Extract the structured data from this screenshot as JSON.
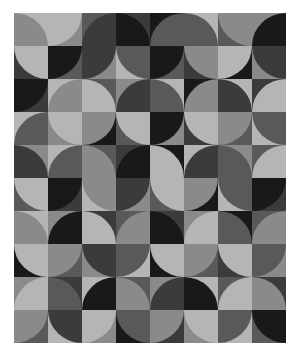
{
  "artwork": {
    "title": "Quarter-Circle Tile Pattern",
    "grid": {
      "columns": 8,
      "rows": 10,
      "tile_width": 34,
      "tile_height": 33
    },
    "canvas": {
      "x": 14,
      "y": 13,
      "width": 272,
      "height": 330,
      "background": "#ffffff"
    },
    "palette": {
      "p0": "#191919",
      "p1": "#3b3b3b",
      "p2": "#595959",
      "p3": "#8a8a8a",
      "p4": "#b5b5b5"
    },
    "corners": [
      "tl",
      "tr",
      "bl",
      "br"
    ],
    "tiles": [
      [
        {
          "bg": "p4",
          "arc": "p3",
          "corner": "bl"
        },
        {
          "bg": "p3",
          "arc": "p4",
          "corner": "tl"
        },
        {
          "bg": "p2",
          "arc": "p1",
          "corner": "br"
        },
        {
          "bg": "p1",
          "arc": "p0",
          "corner": "bl"
        },
        {
          "bg": "p0",
          "arc": "p2",
          "corner": "br"
        },
        {
          "bg": "p4",
          "arc": "p2",
          "corner": "bl"
        },
        {
          "bg": "p2",
          "arc": "p3",
          "corner": "tr"
        },
        {
          "bg": "p3",
          "arc": "p0",
          "corner": "br"
        }
      ],
      [
        {
          "bg": "p1",
          "arc": "p4",
          "corner": "tr"
        },
        {
          "bg": "p2",
          "arc": "p0",
          "corner": "tl"
        },
        {
          "bg": "p3",
          "arc": "p1",
          "corner": "tl"
        },
        {
          "bg": "p4",
          "arc": "p2",
          "corner": "tr"
        },
        {
          "bg": "p2",
          "arc": "p0",
          "corner": "tl"
        },
        {
          "bg": "p1",
          "arc": "p3",
          "corner": "tr"
        },
        {
          "bg": "p0",
          "arc": "p4",
          "corner": "tl"
        },
        {
          "bg": "p3",
          "arc": "p1",
          "corner": "tr"
        }
      ],
      [
        {
          "bg": "p1",
          "arc": "p0",
          "corner": "tl"
        },
        {
          "bg": "p4",
          "arc": "p3",
          "corner": "br"
        },
        {
          "bg": "p2",
          "arc": "p4",
          "corner": "bl"
        },
        {
          "bg": "p3",
          "arc": "p1",
          "corner": "br"
        },
        {
          "bg": "p4",
          "arc": "p2",
          "corner": "bl"
        },
        {
          "bg": "p0",
          "arc": "p3",
          "corner": "br"
        },
        {
          "bg": "p4",
          "arc": "p1",
          "corner": "bl"
        },
        {
          "bg": "p1",
          "arc": "p4",
          "corner": "br"
        }
      ],
      [
        {
          "bg": "p4",
          "arc": "p2",
          "corner": "br"
        },
        {
          "bg": "p3",
          "arc": "p4",
          "corner": "tr"
        },
        {
          "bg": "p0",
          "arc": "p3",
          "corner": "tl"
        },
        {
          "bg": "p2",
          "arc": "p4",
          "corner": "tr"
        },
        {
          "bg": "p3",
          "arc": "p0",
          "corner": "tl"
        },
        {
          "bg": "p1",
          "arc": "p4",
          "corner": "tr"
        },
        {
          "bg": "p2",
          "arc": "p3",
          "corner": "tl"
        },
        {
          "bg": "p4",
          "arc": "p2",
          "corner": "tr"
        }
      ],
      [
        {
          "bg": "p3",
          "arc": "p1",
          "corner": "bl"
        },
        {
          "bg": "p4",
          "arc": "p2",
          "corner": "br"
        },
        {
          "bg": "p2",
          "arc": "p3",
          "corner": "bl"
        },
        {
          "bg": "p1",
          "arc": "p0",
          "corner": "br"
        },
        {
          "bg": "p0",
          "arc": "p4",
          "corner": "bl"
        },
        {
          "bg": "p4",
          "arc": "p1",
          "corner": "br"
        },
        {
          "bg": "p3",
          "arc": "p2",
          "corner": "bl"
        },
        {
          "bg": "p2",
          "arc": "p4",
          "corner": "br"
        }
      ],
      [
        {
          "bg": "p2",
          "arc": "p4",
          "corner": "tr"
        },
        {
          "bg": "p1",
          "arc": "p0",
          "corner": "tl"
        },
        {
          "bg": "p4",
          "arc": "p3",
          "corner": "tr"
        },
        {
          "bg": "p3",
          "arc": "p1",
          "corner": "tl"
        },
        {
          "bg": "p2",
          "arc": "p4",
          "corner": "tr"
        },
        {
          "bg": "p0",
          "arc": "p3",
          "corner": "tl"
        },
        {
          "bg": "p4",
          "arc": "p2",
          "corner": "tr"
        },
        {
          "bg": "p1",
          "arc": "p0",
          "corner": "tl"
        }
      ],
      [
        {
          "bg": "p4",
          "arc": "p3",
          "corner": "bl"
        },
        {
          "bg": "p3",
          "arc": "p0",
          "corner": "br"
        },
        {
          "bg": "p1",
          "arc": "p4",
          "corner": "bl"
        },
        {
          "bg": "p2",
          "arc": "p3",
          "corner": "br"
        },
        {
          "bg": "p1",
          "arc": "p0",
          "corner": "bl"
        },
        {
          "bg": "p3",
          "arc": "p4",
          "corner": "br"
        },
        {
          "bg": "p0",
          "arc": "p2",
          "corner": "bl"
        },
        {
          "bg": "p2",
          "arc": "p3",
          "corner": "br"
        }
      ],
      [
        {
          "bg": "p0",
          "arc": "p4",
          "corner": "tr"
        },
        {
          "bg": "p2",
          "arc": "p3",
          "corner": "tl"
        },
        {
          "bg": "p3",
          "arc": "p1",
          "corner": "tr"
        },
        {
          "bg": "p4",
          "arc": "p2",
          "corner": "tl"
        },
        {
          "bg": "p0",
          "arc": "p4",
          "corner": "tr"
        },
        {
          "bg": "p2",
          "arc": "p3",
          "corner": "tl"
        },
        {
          "bg": "p1",
          "arc": "p4",
          "corner": "tr"
        },
        {
          "bg": "p3",
          "arc": "p2",
          "corner": "tl"
        }
      ],
      [
        {
          "bg": "p3",
          "arc": "p4",
          "corner": "br"
        },
        {
          "bg": "p1",
          "arc": "p2",
          "corner": "bl"
        },
        {
          "bg": "p4",
          "arc": "p0",
          "corner": "br"
        },
        {
          "bg": "p2",
          "arc": "p3",
          "corner": "bl"
        },
        {
          "bg": "p3",
          "arc": "p1",
          "corner": "br"
        },
        {
          "bg": "p4",
          "arc": "p0",
          "corner": "bl"
        },
        {
          "bg": "p2",
          "arc": "p4",
          "corner": "br"
        },
        {
          "bg": "p1",
          "arc": "p3",
          "corner": "bl"
        }
      ],
      [
        {
          "bg": "p2",
          "arc": "p3",
          "corner": "tl"
        },
        {
          "bg": "p4",
          "arc": "p1",
          "corner": "tr"
        },
        {
          "bg": "p3",
          "arc": "p4",
          "corner": "tl"
        },
        {
          "bg": "p0",
          "arc": "p2",
          "corner": "tr"
        },
        {
          "bg": "p1",
          "arc": "p3",
          "corner": "tl"
        },
        {
          "bg": "p3",
          "arc": "p4",
          "corner": "tr"
        },
        {
          "bg": "p4",
          "arc": "p2",
          "corner": "tl"
        },
        {
          "bg": "p2",
          "arc": "p0",
          "corner": "tr"
        }
      ]
    ]
  }
}
